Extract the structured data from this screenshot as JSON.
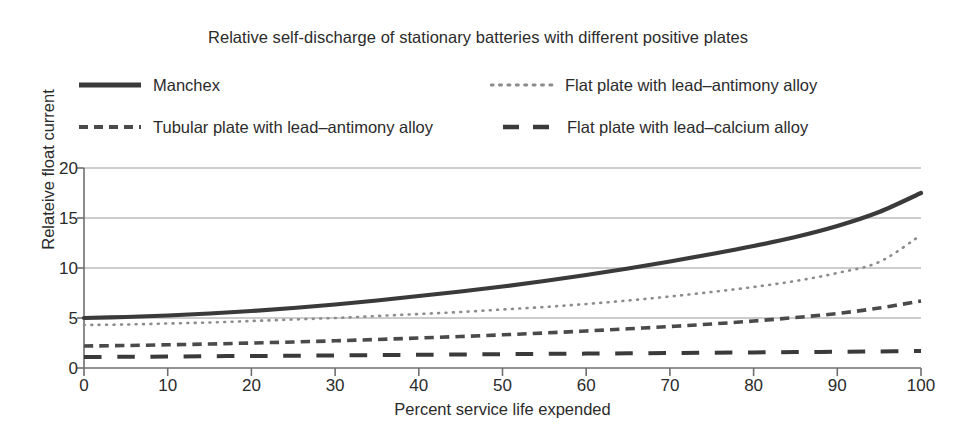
{
  "chart_data": {
    "type": "line",
    "title": "Relative self-discharge of stationary batteries with different positive plates",
    "xlabel": "Percent service life expended",
    "ylabel": "Relateive float current",
    "xlim": [
      0,
      100
    ],
    "ylim": [
      0,
      20
    ],
    "xticks": [
      0,
      10,
      20,
      30,
      40,
      50,
      60,
      70,
      80,
      90,
      100
    ],
    "yticks": [
      0,
      5,
      10,
      15,
      20
    ],
    "grid": "horizontal",
    "legend_position": "top",
    "x": [
      0,
      5,
      10,
      15,
      20,
      25,
      30,
      35,
      40,
      45,
      50,
      55,
      60,
      65,
      70,
      75,
      80,
      85,
      90,
      95,
      100
    ],
    "series": [
      {
        "name": "Manchex",
        "style": "solid",
        "color": "#3a3a3a",
        "width": 4.2,
        "values": [
          5.0,
          5.1,
          5.25,
          5.45,
          5.7,
          6.0,
          6.35,
          6.75,
          7.2,
          7.65,
          8.15,
          8.7,
          9.3,
          9.95,
          10.65,
          11.4,
          12.2,
          13.1,
          14.2,
          15.6,
          17.5
        ]
      },
      {
        "name": "Flat plate with lead–antimony alloy",
        "style": "dotted",
        "color": "#8c8c8c",
        "width": 2.6,
        "values": [
          4.3,
          4.35,
          4.45,
          4.55,
          4.7,
          4.85,
          5.0,
          5.2,
          5.4,
          5.6,
          5.85,
          6.1,
          6.4,
          6.75,
          7.15,
          7.6,
          8.1,
          8.7,
          9.5,
          10.6,
          13.3
        ]
      },
      {
        "name": "Tubular plate with lead–antimony alloy",
        "style": "dashed",
        "color": "#4a4a4a",
        "width": 3.6,
        "values": [
          2.2,
          2.25,
          2.32,
          2.4,
          2.5,
          2.6,
          2.72,
          2.85,
          3.0,
          3.15,
          3.32,
          3.5,
          3.7,
          3.92,
          4.15,
          4.4,
          4.7,
          5.05,
          5.45,
          6.0,
          6.7
        ]
      },
      {
        "name": "Flat plate with lead–calcium alloy",
        "style": "longdash",
        "color": "#3a3a3a",
        "width": 4.0,
        "values": [
          1.1,
          1.12,
          1.15,
          1.18,
          1.2,
          1.23,
          1.26,
          1.29,
          1.32,
          1.35,
          1.38,
          1.41,
          1.44,
          1.47,
          1.5,
          1.53,
          1.56,
          1.59,
          1.62,
          1.66,
          1.7
        ]
      }
    ]
  },
  "legend": {
    "items": [
      {
        "label": "Manchex",
        "marker": "solid-line-swatch"
      },
      {
        "label": "Flat plate with lead–antimony alloy",
        "marker": "dotted-line-swatch"
      },
      {
        "label": "Tubular plate with lead–antimony alloy",
        "marker": "dashed-line-swatch"
      },
      {
        "label": "Flat plate with lead–calcium alloy",
        "marker": "long-dashed-line-swatch"
      }
    ]
  },
  "colors": {
    "text": "#2b2b2b",
    "grid": "#9a9a9a",
    "axis": "#6f6f6f",
    "background": "#ffffff"
  }
}
